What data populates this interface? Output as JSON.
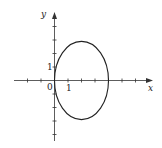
{
  "chart_data": {
    "type": "line",
    "title": "",
    "xlabel": "x",
    "ylabel": "y",
    "xlim": [
      -4,
      7
    ],
    "ylim": [
      -4.5,
      5
    ],
    "grid": false,
    "legend": [],
    "tick_labels": {
      "origin": "0",
      "x_one": "1",
      "y_one": "1"
    },
    "x_ticks": [
      -2,
      -1,
      1,
      2,
      3,
      4,
      5,
      6
    ],
    "y_ticks": [
      -4,
      -3,
      -2,
      -1,
      1,
      2,
      3,
      4
    ],
    "series": [
      {
        "name": "closed curve (ellipse)",
        "shape": "ellipse",
        "center": [
          2,
          0
        ],
        "x_radius": 2,
        "y_radius": 2.9,
        "points": [
          [
            0,
            0
          ],
          [
            2,
            2.9
          ],
          [
            4,
            0
          ],
          [
            2,
            -2.9
          ]
        ]
      }
    ]
  },
  "colors": {
    "axis": "#333333",
    "curve": "#222222",
    "background": "#ffffff"
  }
}
